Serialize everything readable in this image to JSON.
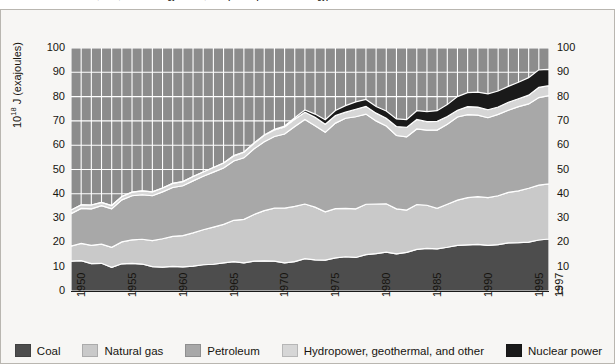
{
  "caption": {
    "text": "Information Administration, 1997; Annual Energy Review, 1997 (U.S. Department of Energy)"
  },
  "axes": {
    "y_label_prefix": "10",
    "y_label_exponent": "18",
    "y_label_suffix": " J (exajoules)",
    "y_ticks": [
      "100",
      "90",
      "80",
      "70",
      "60",
      "50",
      "40",
      "30",
      "20",
      "10",
      "0"
    ],
    "y_ticks_right": [
      "100",
      "90",
      "80",
      "70",
      "60",
      "50",
      "40",
      "30",
      "20",
      "10",
      "0"
    ],
    "x_ticks": [
      "1950",
      "1955",
      "1960",
      "1965",
      "1970",
      "1975",
      "1980",
      "1985",
      "1990",
      "1995",
      "1997"
    ]
  },
  "legend": {
    "items": [
      {
        "label": "Coal",
        "color": "#4d4d4d",
        "icon": "legend-swatch-coal"
      },
      {
        "label": "Natural gas",
        "color": "#c9c9c9",
        "icon": "legend-swatch-natural-gas"
      },
      {
        "label": "Petroleum",
        "color": "#a8a8a8",
        "icon": "legend-swatch-petroleum"
      },
      {
        "label": "Hydropower, geothermal, and other",
        "color": "#d6d6d6",
        "icon": "legend-swatch-hydropower"
      },
      {
        "label": "Nuclear power",
        "color": "#1a1a1a",
        "icon": "legend-swatch-nuclear"
      }
    ]
  },
  "chart_data": {
    "type": "area",
    "title": "",
    "subtitle": "",
    "xlabel": "",
    "ylabel": "10^18 J (exajoules)",
    "xlim": [
      1950,
      1997
    ],
    "ylim": [
      0,
      100
    ],
    "grid": true,
    "grid_color": "#ffffff",
    "plot_background": "#8c8c8c",
    "legend_position": "bottom",
    "stacked": true,
    "stack_order_bottom_to_top": [
      "Coal",
      "Natural gas",
      "Petroleum",
      "Hydropower, geothermal, and other",
      "Nuclear power"
    ],
    "x": [
      1950,
      1951,
      1952,
      1953,
      1954,
      1955,
      1956,
      1957,
      1958,
      1959,
      1960,
      1961,
      1962,
      1963,
      1964,
      1965,
      1966,
      1967,
      1968,
      1969,
      1970,
      1971,
      1972,
      1973,
      1974,
      1975,
      1976,
      1977,
      1978,
      1979,
      1980,
      1981,
      1982,
      1983,
      1984,
      1985,
      1986,
      1987,
      1988,
      1989,
      1990,
      1991,
      1992,
      1993,
      1994,
      1995,
      1996,
      1997
    ],
    "series": [
      {
        "name": "Coal",
        "color": "#4d4d4d",
        "values": [
          12.3,
          12.5,
          11.3,
          11.4,
          9.7,
          11.2,
          11.4,
          11.1,
          10.0,
          9.8,
          10.1,
          9.9,
          10.2,
          10.8,
          11.0,
          11.6,
          12.1,
          11.6,
          12.3,
          12.4,
          12.3,
          11.6,
          12.1,
          13.3,
          12.8,
          12.7,
          13.6,
          14.1,
          13.8,
          15.0,
          15.4,
          16.0,
          15.3,
          15.9,
          17.1,
          17.5,
          17.3,
          18.0,
          18.8,
          19.0,
          19.2,
          18.8,
          19.1,
          19.8,
          19.9,
          20.1,
          21.0,
          21.4
        ]
      },
      {
        "name": "Natural gas",
        "color": "#c9c9c9",
        "values": [
          6.2,
          7.1,
          7.5,
          7.9,
          8.3,
          9.0,
          9.6,
          10.2,
          10.7,
          11.7,
          12.4,
          12.9,
          13.7,
          14.4,
          15.3,
          15.8,
          17.0,
          17.9,
          19.2,
          20.7,
          21.8,
          22.5,
          22.7,
          22.5,
          21.7,
          19.9,
          20.3,
          19.9,
          20.0,
          20.7,
          20.4,
          19.9,
          18.5,
          17.4,
          18.5,
          17.8,
          16.7,
          17.7,
          18.6,
          19.4,
          19.6,
          19.6,
          20.1,
          20.8,
          21.3,
          22.2,
          22.6,
          22.7
        ]
      },
      {
        "name": "Petroleum",
        "color": "#a8a8a8",
        "values": [
          13.3,
          14.4,
          15.0,
          15.8,
          15.8,
          17.3,
          18.2,
          18.3,
          18.5,
          19.3,
          20.1,
          20.5,
          21.4,
          22.0,
          22.6,
          23.2,
          24.4,
          25.3,
          27.0,
          28.3,
          29.5,
          30.5,
          32.9,
          34.8,
          33.5,
          32.7,
          35.2,
          37.1,
          37.9,
          37.1,
          34.2,
          32.0,
          30.2,
          30.1,
          31.1,
          30.9,
          32.2,
          32.9,
          34.2,
          34.2,
          33.6,
          32.9,
          33.5,
          33.8,
          34.7,
          34.7,
          36.0,
          36.3
        ]
      },
      {
        "name": "Hydropower, geothermal, and other",
        "color": "#d6d6d6",
        "values": [
          1.5,
          1.5,
          1.6,
          1.4,
          1.4,
          1.4,
          1.5,
          1.6,
          1.6,
          1.6,
          1.7,
          1.7,
          1.8,
          1.8,
          1.9,
          2.1,
          2.1,
          2.3,
          2.3,
          2.7,
          2.7,
          2.9,
          3.0,
          3.0,
          3.5,
          3.3,
          3.1,
          2.5,
          3.1,
          3.2,
          3.2,
          3.2,
          3.7,
          3.9,
          3.9,
          3.5,
          3.6,
          3.2,
          2.8,
          3.3,
          3.3,
          3.3,
          3.0,
          3.3,
          3.2,
          3.6,
          4.2,
          4.1
        ]
      },
      {
        "name": "Nuclear power",
        "color": "#1a1a1a",
        "values": [
          0.0,
          0.0,
          0.0,
          0.0,
          0.0,
          0.0,
          0.0,
          0.0,
          0.0,
          0.0,
          0.0,
          0.0,
          0.0,
          0.0,
          0.0,
          0.0,
          0.1,
          0.1,
          0.1,
          0.1,
          0.2,
          0.4,
          0.6,
          0.9,
          1.3,
          1.9,
          2.1,
          2.7,
          3.0,
          2.8,
          2.7,
          3.0,
          3.1,
          3.2,
          3.6,
          4.1,
          4.4,
          4.9,
          5.6,
          5.7,
          6.1,
          6.5,
          6.6,
          6.5,
          6.8,
          7.2,
          7.2,
          6.7
        ]
      }
    ]
  }
}
